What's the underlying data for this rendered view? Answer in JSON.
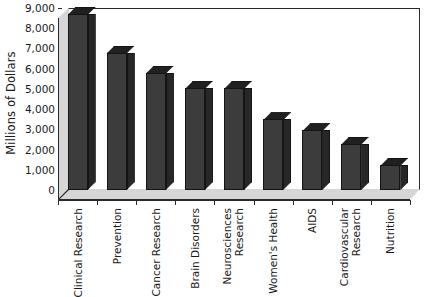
{
  "chart_data": {
    "type": "bar",
    "title": "",
    "subtitle": "",
    "xlabel": "",
    "ylabel": "Millions of Dollars",
    "ylim": [
      0,
      9000
    ],
    "ytick_step": 1000,
    "ytick_labels": [
      "9,000",
      "8,000",
      "7,000",
      "6,000",
      "5,000",
      "4,000",
      "3,000",
      "2,000",
      "1,000",
      "0"
    ],
    "ytick_values": [
      9000,
      8000,
      7000,
      6000,
      5000,
      4000,
      3000,
      2000,
      1000,
      0
    ],
    "grid": false,
    "legend": false,
    "legend_position": "none",
    "style": "3d-column",
    "bar_color": "#3c3c3c",
    "bar_side_color": "#272727",
    "bar_top_color": "#202020",
    "plot_wall_color": "#d6d6d6",
    "axis_color": "#2b2b2b",
    "categories": [
      "Clinical Research",
      "Prevention",
      "Cancer Research",
      "Brain Disorders",
      "Neurosciences Research",
      "Women's Health",
      "AIDS",
      "Cardiovascular Research",
      "Nutrition"
    ],
    "category_lines": [
      [
        "Clinical Research"
      ],
      [
        "Prevention"
      ],
      [
        "Cancer Research"
      ],
      [
        "Brain Disorders"
      ],
      [
        "Neurosciences",
        "Research"
      ],
      [
        "Women's Health"
      ],
      [
        "AIDS"
      ],
      [
        "Cardiovascular",
        "Research"
      ],
      [
        "Nutrition"
      ]
    ],
    "values": [
      8700,
      6800,
      5800,
      5050,
      5050,
      3500,
      2950,
      2300,
      1250
    ]
  }
}
